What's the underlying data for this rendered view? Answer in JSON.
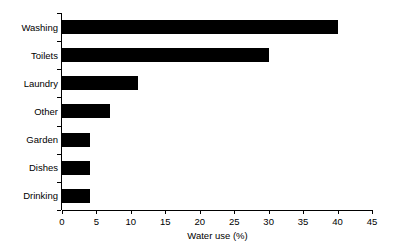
{
  "chart_data": {
    "type": "bar",
    "orientation": "horizontal",
    "title": "",
    "xlabel": "Water use (%)",
    "ylabel": "",
    "categories": [
      "Washing",
      "Toilets",
      "Laundry",
      "Other",
      "Garden",
      "Dishes",
      "Drinking"
    ],
    "values": [
      40,
      30,
      11,
      7,
      4,
      4,
      4
    ],
    "series": [
      {
        "name": "Water use (%)",
        "values": [
          40,
          30,
          11,
          7,
          4,
          4,
          4
        ]
      }
    ],
    "xlim": [
      0,
      45
    ],
    "xticks": [
      0,
      5,
      10,
      15,
      20,
      25,
      30,
      35,
      40,
      45
    ],
    "xtick_labels": [
      "0",
      "5",
      "10",
      "15",
      "20",
      "25",
      "30",
      "35",
      "40",
      "45"
    ],
    "grid": false,
    "legend": false,
    "bar_color": "#000000",
    "axis_color": "#000000",
    "background": "#ffffff"
  }
}
